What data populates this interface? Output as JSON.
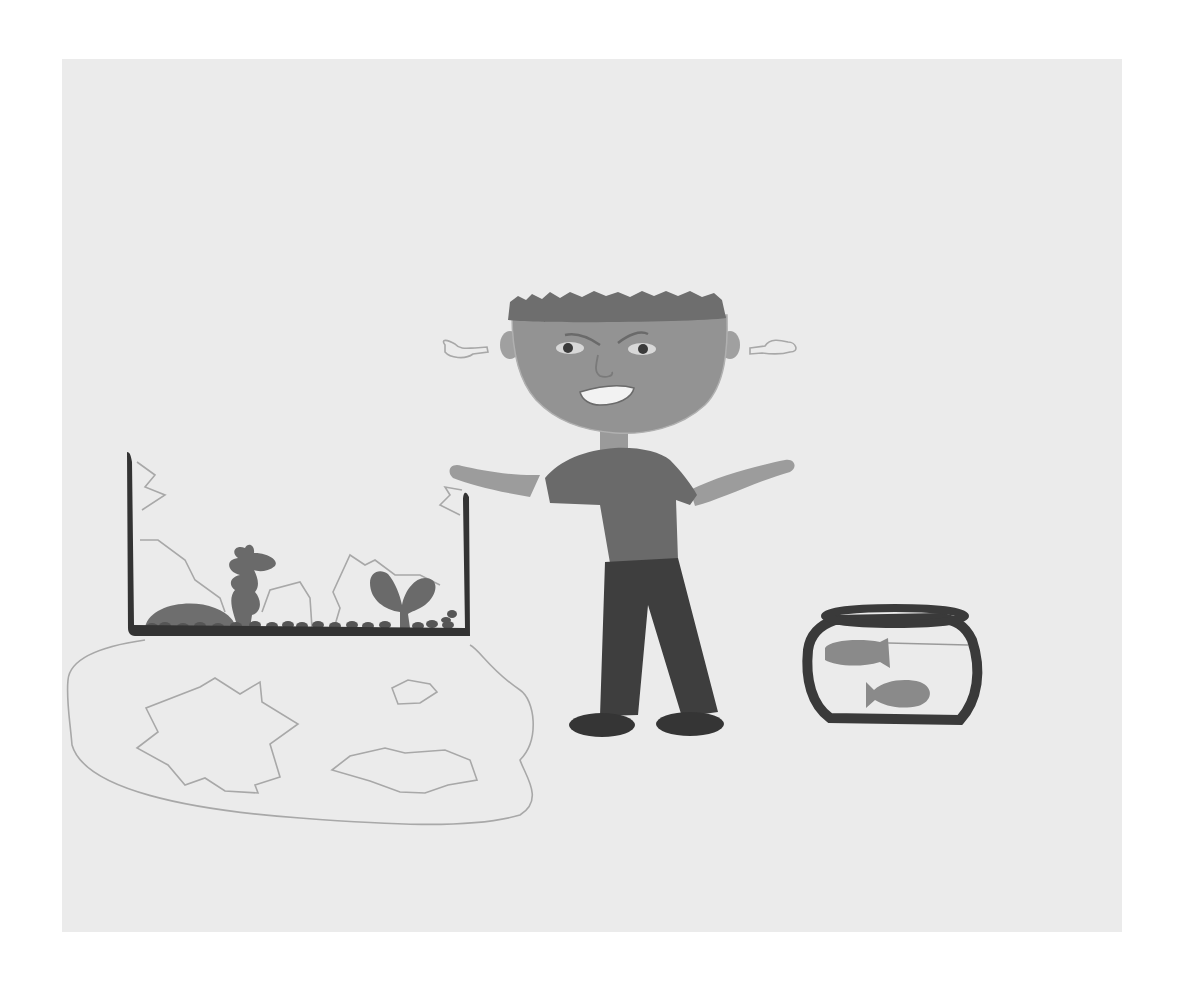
{
  "image": {
    "kind": "children-drawing-grayscale",
    "description": "Angry boy standing between a broken, leaking aquarium and a small fishbowl with two goldfish"
  },
  "colors": {
    "page_bg": "#ffffff",
    "paper": "#ebebeb",
    "outline_dark": "#3a3a3a",
    "hair": "#6e6e6e",
    "skin": "#9a9a9a",
    "shirt": "#6a6a6a",
    "pants": "#3e3e3e",
    "shoes": "#3a3a3a",
    "plant": "#707070",
    "fish": "#8a8a8a",
    "pencil_line": "#a8a8a8"
  },
  "scene": {
    "aquarium": {
      "label": "broken aquarium with plants, rock and gravel",
      "state": "cracked, water spilled"
    },
    "puddle": {
      "label": "spilled water puddle with broken glass shards"
    },
    "boy": {
      "label": "angry boy with arms outstretched, steam from ears",
      "expression": "angry"
    },
    "fishbowl": {
      "label": "round fishbowl",
      "fish_count": "2"
    }
  }
}
